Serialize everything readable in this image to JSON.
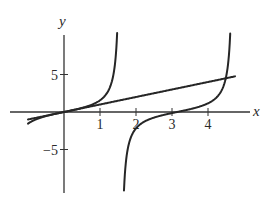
{
  "chart_data": {
    "type": "line",
    "title": "",
    "xlabel": "x",
    "ylabel": "y",
    "xlim": [
      -1.5,
      5.1
    ],
    "ylim": [
      -10.8,
      10.3
    ],
    "grid": false,
    "legend": null,
    "x_ticks": [
      1,
      2,
      3,
      4
    ],
    "x_tick_labels": [
      "1",
      "2",
      "3",
      "4"
    ],
    "y_ticks": [
      5,
      -5
    ],
    "y_tick_labels": [
      "5",
      "−5"
    ],
    "series": [
      {
        "name": "y = x",
        "function": "x",
        "x_range": [
          -1.0,
          4.75
        ]
      },
      {
        "name": "y = tan x (branch 1)",
        "function": "tan(x)",
        "x_range": [
          -1.0,
          1.476
        ]
      },
      {
        "name": "y = tan x (branch 2)",
        "function": "tan(x)",
        "x_range": [
          1.666,
          4.617
        ]
      }
    ],
    "intersections": [
      {
        "x": 0,
        "y": 0
      },
      {
        "x": 4.493,
        "y": 4.493
      }
    ],
    "colors": {
      "curve": "#262626",
      "axis": "#333333",
      "text": "#2a2a2a"
    }
  }
}
